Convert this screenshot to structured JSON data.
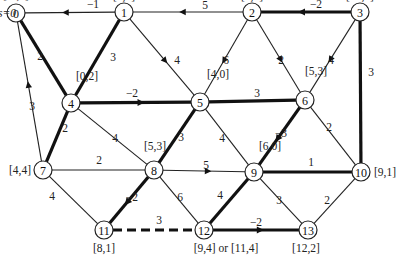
{
  "source_label": "s=0",
  "nodes": [
    {
      "id": "0",
      "label": "[ · ,0]"
    },
    {
      "id": "1",
      "label": "[4,5]"
    },
    {
      "id": "2",
      "label": "[3,2]"
    },
    {
      "id": "3",
      "label": "[10,4]"
    },
    {
      "id": "4",
      "label": "[0,2]"
    },
    {
      "id": "5",
      "label": "[4,0]"
    },
    {
      "id": "6",
      "label": "[5,3]"
    },
    {
      "id": "7",
      "label": "[4,4]"
    },
    {
      "id": "8",
      "label": "[5,3]"
    },
    {
      "id": "9",
      "label": "[6,0]"
    },
    {
      "id": "10",
      "label": "[9,1]"
    },
    {
      "id": "11",
      "label": "[8,1]"
    },
    {
      "id": "12",
      "label": "[9,4] or [11,4]"
    },
    {
      "id": "13",
      "label": "[12,2]"
    }
  ],
  "edges": [
    {
      "from": "1",
      "to": "0",
      "weight": "−1",
      "bold": false,
      "directed": true
    },
    {
      "from": "2",
      "to": "1",
      "weight": "5",
      "bold": false,
      "directed": true
    },
    {
      "from": "3",
      "to": "2",
      "weight": "−2",
      "bold": true,
      "directed": true
    },
    {
      "from": "0",
      "to": "4",
      "weight": "2",
      "bold": true,
      "directed": false
    },
    {
      "from": "1",
      "to": "4",
      "weight": "3",
      "bold": true,
      "directed": false
    },
    {
      "from": "1",
      "to": "5",
      "weight": "4",
      "bold": false,
      "directed": true
    },
    {
      "from": "2",
      "to": "5",
      "weight": "6",
      "bold": false,
      "directed": true
    },
    {
      "from": "2",
      "to": "6",
      "weight": "2",
      "bold": false,
      "directed": true
    },
    {
      "from": "3",
      "to": "6",
      "weight": "4",
      "bold": false,
      "directed": true
    },
    {
      "from": "3",
      "to": "10",
      "weight": "3",
      "bold": true,
      "directed": false
    },
    {
      "from": "4",
      "to": "5",
      "weight": "−2",
      "bold": true,
      "directed": true
    },
    {
      "from": "5",
      "to": "6",
      "weight": "3",
      "bold": true,
      "directed": false
    },
    {
      "from": "7",
      "to": "0",
      "weight": "3",
      "bold": false,
      "directed": true
    },
    {
      "from": "4",
      "to": "7",
      "weight": "2",
      "bold": true,
      "directed": false
    },
    {
      "from": "4",
      "to": "8",
      "weight": "4",
      "bold": false,
      "directed": false
    },
    {
      "from": "5",
      "to": "8",
      "weight": "3",
      "bold": true,
      "directed": false
    },
    {
      "from": "5",
      "to": "9",
      "weight": "4",
      "bold": false,
      "directed": false
    },
    {
      "from": "6",
      "to": "9",
      "weight": "−3",
      "bold": true,
      "directed": true
    },
    {
      "from": "6",
      "to": "10",
      "weight": "2",
      "bold": false,
      "directed": false
    },
    {
      "from": "7",
      "to": "8",
      "weight": "2",
      "bold": false,
      "directed": false
    },
    {
      "from": "8",
      "to": "9",
      "weight": "5",
      "bold": false,
      "directed": true
    },
    {
      "from": "9",
      "to": "10",
      "weight": "1",
      "bold": true,
      "directed": false
    },
    {
      "from": "7",
      "to": "11",
      "weight": "4",
      "bold": false,
      "directed": false
    },
    {
      "from": "8",
      "to": "11",
      "weight": "−2",
      "bold": true,
      "directed": true
    },
    {
      "from": "8",
      "to": "12",
      "weight": "6",
      "bold": false,
      "directed": false
    },
    {
      "from": "9",
      "to": "12",
      "weight": "4",
      "bold": true,
      "directed": false
    },
    {
      "from": "9",
      "to": "13",
      "weight": "3",
      "bold": false,
      "directed": false
    },
    {
      "from": "10",
      "to": "13",
      "weight": "2",
      "bold": false,
      "directed": false
    },
    {
      "from": "11",
      "to": "12",
      "weight": "3",
      "bold": true,
      "directed": false,
      "dashed": true
    },
    {
      "from": "12",
      "to": "13",
      "weight": "−2",
      "bold": true,
      "directed": true
    }
  ]
}
